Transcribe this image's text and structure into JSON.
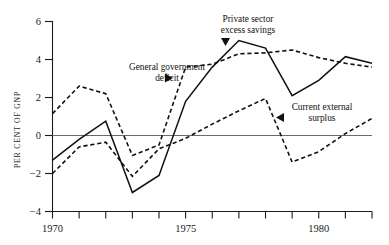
{
  "chart_data": {
    "type": "line",
    "title": "",
    "xlabel": "",
    "ylabel": "PER CENT OF GNP",
    "x": [
      1970,
      1971,
      1972,
      1973,
      1974,
      1975,
      1976,
      1977,
      1978,
      1979,
      1980,
      1981,
      1982
    ],
    "xlim": [
      1970,
      1982
    ],
    "ylim": [
      -4,
      6
    ],
    "yticks": [
      -4,
      -2,
      0,
      2,
      4,
      6
    ],
    "ytick_labels": [
      "−4",
      "−2",
      "0",
      "2",
      "4",
      "6"
    ],
    "xticks": [
      1970,
      1971,
      1972,
      1973,
      1974,
      1975,
      1976,
      1977,
      1978,
      1979,
      1980,
      1981,
      1982
    ],
    "xtick_labels_shown": [
      {
        "value": 1970,
        "label": "1970"
      },
      {
        "value": 1975,
        "label": "1975"
      },
      {
        "value": 1980,
        "label": "1980"
      }
    ],
    "grid": false,
    "zero_line": true,
    "legend_position": "inline-annotations",
    "series": [
      {
        "name": "Private sector excess savings",
        "style": "solid",
        "color": "#111111",
        "values": [
          -1.3,
          -0.2,
          0.75,
          -3.0,
          -2.1,
          1.8,
          3.6,
          5.0,
          4.6,
          2.1,
          2.9,
          4.15,
          3.8
        ]
      },
      {
        "name": "General government deficit",
        "style": "dashed",
        "color": "#111111",
        "values": [
          1.15,
          2.6,
          2.2,
          -1.05,
          -0.5,
          3.6,
          3.75,
          4.3,
          4.35,
          4.5,
          4.1,
          3.8,
          3.6
        ]
      },
      {
        "name": "Current external surplus",
        "style": "dashed",
        "color": "#111111",
        "values": [
          -2.0,
          -0.6,
          -0.35,
          -2.15,
          -0.7,
          -0.15,
          0.6,
          1.3,
          1.95,
          -1.4,
          -0.85,
          0.1,
          0.9
        ]
      }
    ],
    "annotations": [
      {
        "id": "general-government-deficit",
        "line1": "General government",
        "line2": "deficit",
        "marker": "triangle-right",
        "text_x": 118,
        "text_y": 66,
        "marker_x": 166,
        "marker_y": 82
      },
      {
        "id": "private-sector-excess-savings",
        "line1": "Private sector",
        "line2": "excess savings",
        "marker": "triangle-down",
        "text_x": 222,
        "text_y": 20,
        "marker_x": 225,
        "marker_y": 38
      },
      {
        "id": "current-external-surplus",
        "line1": "Current external",
        "line2": "surplus",
        "marker": "triangle-left",
        "text_x": 291,
        "text_y": 105,
        "marker_x": 278,
        "marker_y": 120
      }
    ]
  },
  "axes": {
    "axis_color": "#1a1a1a",
    "zero_line_color": "#6b6b6b"
  }
}
